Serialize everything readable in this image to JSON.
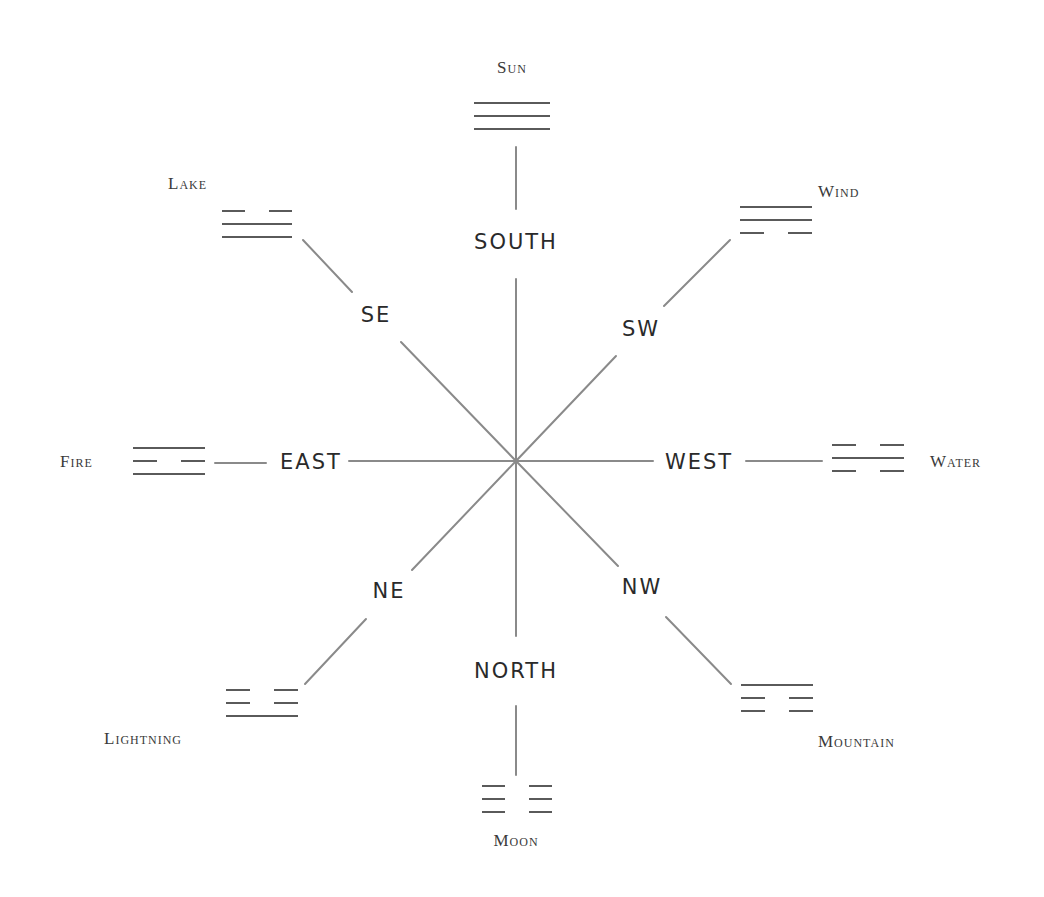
{
  "center": {
    "x": 516,
    "y": 461
  },
  "colors": {
    "line": "#8a8a8a",
    "bar": "#5a5a5a",
    "text": "#2a2a2a",
    "background": "#ffffff"
  },
  "directions": [
    {
      "id": "south",
      "label": "SOUTH",
      "x": 516,
      "y": 243
    },
    {
      "id": "se",
      "label": "SE",
      "x": 376,
      "y": 316
    },
    {
      "id": "sw",
      "label": "SW",
      "x": 641,
      "y": 330
    },
    {
      "id": "east",
      "label": "EAST",
      "x": 311,
      "y": 463
    },
    {
      "id": "west",
      "label": "WEST",
      "x": 699,
      "y": 463
    },
    {
      "id": "ne",
      "label": "NE",
      "x": 389,
      "y": 592
    },
    {
      "id": "nw",
      "label": "NW",
      "x": 642,
      "y": 588
    },
    {
      "id": "north",
      "label": "NORTH",
      "x": 516,
      "y": 672
    }
  ],
  "trigrams": [
    {
      "id": "sun",
      "name": "Sun",
      "lines": [
        "solid",
        "solid",
        "solid"
      ],
      "x": 474,
      "y": 103,
      "width": 76,
      "label_x": 512,
      "label_y": 69,
      "label_anchor": "middle"
    },
    {
      "id": "lake",
      "name": "Lake",
      "lines": [
        "broken",
        "solid",
        "solid"
      ],
      "x": 222,
      "y": 211,
      "width": 70,
      "label_x": 168,
      "label_y": 185,
      "label_anchor": "start"
    },
    {
      "id": "wind",
      "name": "Wind",
      "lines": [
        "solid",
        "solid",
        "broken"
      ],
      "x": 740,
      "y": 207,
      "width": 72,
      "label_x": 818,
      "label_y": 193,
      "label_anchor": "start"
    },
    {
      "id": "fire",
      "name": "Fire",
      "lines": [
        "solid",
        "broken",
        "solid"
      ],
      "x": 133,
      "y": 448,
      "width": 72,
      "label_x": 60,
      "label_y": 463,
      "label_anchor": "start"
    },
    {
      "id": "water",
      "name": "Water",
      "lines": [
        "broken",
        "solid",
        "broken"
      ],
      "x": 832,
      "y": 445,
      "width": 72,
      "label_x": 930,
      "label_y": 463,
      "label_anchor": "start"
    },
    {
      "id": "lightning",
      "name": "Lightning",
      "lines": [
        "broken",
        "broken",
        "solid"
      ],
      "x": 226,
      "y": 690,
      "width": 72,
      "label_x": 104,
      "label_y": 740,
      "label_anchor": "start"
    },
    {
      "id": "mountain",
      "name": "Mountain",
      "lines": [
        "solid",
        "broken",
        "broken"
      ],
      "x": 741,
      "y": 685,
      "width": 72,
      "label_x": 818,
      "label_y": 743,
      "label_anchor": "start"
    },
    {
      "id": "moon",
      "name": "Moon",
      "lines": [
        "broken",
        "broken",
        "broken"
      ],
      "x": 482,
      "y": 786,
      "width": 70,
      "label_x": 516,
      "label_y": 842,
      "label_anchor": "middle"
    }
  ],
  "segments": [
    {
      "id": "south-upper",
      "x1": 516,
      "y1": 147,
      "x2": 516,
      "y2": 209
    },
    {
      "id": "south-lower",
      "x1": 516,
      "y1": 279,
      "x2": 516,
      "y2": 461
    },
    {
      "id": "se-upper",
      "x1": 303,
      "y1": 240,
      "x2": 352,
      "y2": 292
    },
    {
      "id": "se-lower",
      "x1": 401,
      "y1": 342,
      "x2": 516,
      "y2": 461
    },
    {
      "id": "sw-upper",
      "x1": 664,
      "y1": 306,
      "x2": 730,
      "y2": 240
    },
    {
      "id": "sw-lower",
      "x1": 516,
      "y1": 461,
      "x2": 616,
      "y2": 356
    },
    {
      "id": "east-left",
      "x1": 215,
      "y1": 463,
      "x2": 266,
      "y2": 463
    },
    {
      "id": "east-right",
      "x1": 349,
      "y1": 461,
      "x2": 516,
      "y2": 461
    },
    {
      "id": "west-left",
      "x1": 516,
      "y1": 461,
      "x2": 653,
      "y2": 461
    },
    {
      "id": "west-right",
      "x1": 746,
      "y1": 461,
      "x2": 822,
      "y2": 461
    },
    {
      "id": "ne-upper",
      "x1": 412,
      "y1": 570,
      "x2": 516,
      "y2": 461
    },
    {
      "id": "ne-lower",
      "x1": 305,
      "y1": 684,
      "x2": 366,
      "y2": 619
    },
    {
      "id": "nw-upper",
      "x1": 516,
      "y1": 461,
      "x2": 618,
      "y2": 566
    },
    {
      "id": "nw-lower",
      "x1": 666,
      "y1": 617,
      "x2": 731,
      "y2": 684
    },
    {
      "id": "north-upper",
      "x1": 516,
      "y1": 461,
      "x2": 516,
      "y2": 636
    },
    {
      "id": "north-lower",
      "x1": 516,
      "y1": 706,
      "x2": 516,
      "y2": 775
    }
  ]
}
